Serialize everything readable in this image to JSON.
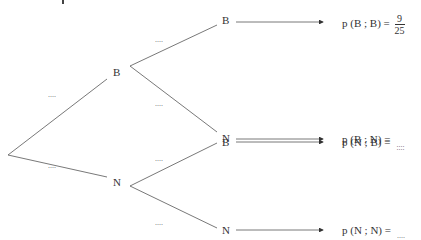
{
  "diagram": {
    "type": "probability-tree",
    "root": {
      "branches": [
        {
          "label": "B",
          "probability": "....",
          "children": [
            {
              "label": "B",
              "probability": "....",
              "result": {
                "expr": "p (B ; B) =",
                "value_num": "9",
                "value_den": "25"
              }
            },
            {
              "label": "N",
              "probability": "....",
              "result": {
                "expr": "p (B ; N) =",
                "value": "...."
              }
            }
          ]
        },
        {
          "label": "N",
          "probability": "....",
          "children": [
            {
              "label": "B",
              "probability": "....",
              "result": {
                "expr": "p (N ; B) =",
                "value": "...."
              }
            },
            {
              "label": "N",
              "probability": "....",
              "result": {
                "expr": "p (N ; N) =",
                "value": "...."
              }
            }
          ]
        }
      ]
    }
  }
}
